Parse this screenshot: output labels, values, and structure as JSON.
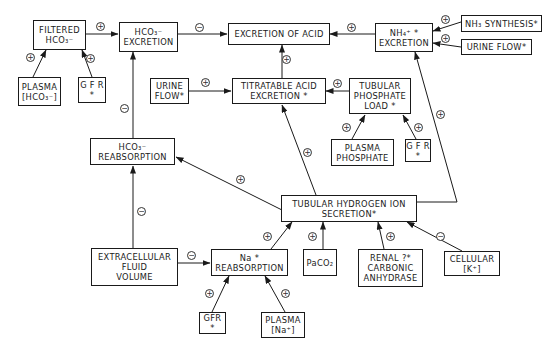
{
  "diagram": {
    "nodes": {
      "filtered_hco3": {
        "lines": [
          "FILTERED",
          "HCO₃⁻"
        ]
      },
      "hco3_excretion": {
        "lines": [
          "HCO₃⁻",
          "EXCRETION"
        ]
      },
      "excretion_of_acid": {
        "lines": [
          "EXCRETION OF ACID"
        ]
      },
      "nh4_excretion": {
        "lines": [
          "NH₄⁺        *",
          "EXCRETION"
        ]
      },
      "nh3_synthesis": {
        "lines": [
          "NH₃ SYNTHESIS*"
        ]
      },
      "urine_flow_right": {
        "lines": [
          "URINE FLOW*"
        ]
      },
      "plasma_hco3": {
        "lines": [
          "PLASMA",
          "[HCO₃⁻]"
        ]
      },
      "gfr_top": {
        "lines": [
          "G F R",
          "*"
        ]
      },
      "urine_flow_mid": {
        "lines": [
          "URINE",
          "FLOW*"
        ]
      },
      "titratable_acid": {
        "lines": [
          "TITRATABLE ACID",
          "EXCRETION   *"
        ]
      },
      "tubular_phosphate": {
        "lines": [
          "TUBULAR",
          "PHOSPHATE",
          "LOAD  *"
        ]
      },
      "plasma_phosphate": {
        "lines": [
          "PLASMA",
          "PHOSPHATE"
        ]
      },
      "gfr_mid": {
        "lines": [
          "G F R",
          "*"
        ]
      },
      "hco3_reabsorption": {
        "lines": [
          "HCO₃⁻",
          "REABSORPTION"
        ]
      },
      "tubular_h_ion": {
        "lines": [
          "TUBULAR HYDROGEN ION",
          "SECRETION*"
        ]
      },
      "extracellular_fluid": {
        "lines": [
          "EXTRACELLULAR",
          "FLUID",
          "VOLUME"
        ]
      },
      "na_reabsorption": {
        "lines": [
          "Na          *",
          "REABSORPTION"
        ]
      },
      "paco2": {
        "lines": [
          "PaCO₂"
        ]
      },
      "renal_ca": {
        "lines": [
          "RENAL  ?*",
          "CARBONIC",
          "ANHYDRASE"
        ]
      },
      "cellular_k": {
        "lines": [
          "CELLULAR",
          "[K⁺]"
        ]
      },
      "gfr_bottom": {
        "lines": [
          "GFR",
          "*"
        ]
      },
      "plasma_na": {
        "lines": [
          "PLASMA",
          "[Na⁺]"
        ]
      }
    },
    "edges": [
      {
        "from": "plasma_hco3",
        "to": "filtered_hco3",
        "sign": "+"
      },
      {
        "from": "gfr_top",
        "to": "filtered_hco3",
        "sign": "+"
      },
      {
        "from": "filtered_hco3",
        "to": "hco3_excretion",
        "sign": "+"
      },
      {
        "from": "hco3_excretion",
        "to": "excretion_of_acid",
        "sign": "−"
      },
      {
        "from": "nh4_excretion",
        "to": "excretion_of_acid",
        "sign": "+"
      },
      {
        "from": "nh3_synthesis",
        "to": "nh4_excretion",
        "sign": "+"
      },
      {
        "from": "urine_flow_right",
        "to": "nh4_excretion",
        "sign": "+"
      },
      {
        "from": "titratable_acid",
        "to": "excretion_of_acid",
        "sign": "+"
      },
      {
        "from": "urine_flow_mid",
        "to": "titratable_acid",
        "sign": "+"
      },
      {
        "from": "tubular_phosphate",
        "to": "titratable_acid",
        "sign": "+"
      },
      {
        "from": "plasma_phosphate",
        "to": "tubular_phosphate",
        "sign": "+"
      },
      {
        "from": "gfr_mid",
        "to": "tubular_phosphate",
        "sign": "+"
      },
      {
        "from": "hco3_reabsorption",
        "to": "hco3_excretion",
        "sign": "−"
      },
      {
        "from": "tubular_h_ion",
        "to": "hco3_reabsorption",
        "sign": "+"
      },
      {
        "from": "tubular_h_ion",
        "to": "titratable_acid",
        "sign": "+"
      },
      {
        "from": "tubular_h_ion",
        "to": "nh4_excretion",
        "sign": "+"
      },
      {
        "from": "extracellular_fluid",
        "to": "hco3_reabsorption",
        "sign": "−"
      },
      {
        "from": "extracellular_fluid",
        "to": "na_reabsorption",
        "sign": "−"
      },
      {
        "from": "na_reabsorption",
        "to": "tubular_h_ion",
        "sign": "+"
      },
      {
        "from": "paco2",
        "to": "tubular_h_ion",
        "sign": "+"
      },
      {
        "from": "renal_ca",
        "to": "tubular_h_ion",
        "sign": "+"
      },
      {
        "from": "cellular_k",
        "to": "tubular_h_ion",
        "sign": "−"
      },
      {
        "from": "gfr_bottom",
        "to": "na_reabsorption",
        "sign": "+"
      },
      {
        "from": "plasma_na",
        "to": "na_reabsorption",
        "sign": "+"
      }
    ],
    "signs": {
      "plus": "+",
      "minus": "−"
    }
  }
}
